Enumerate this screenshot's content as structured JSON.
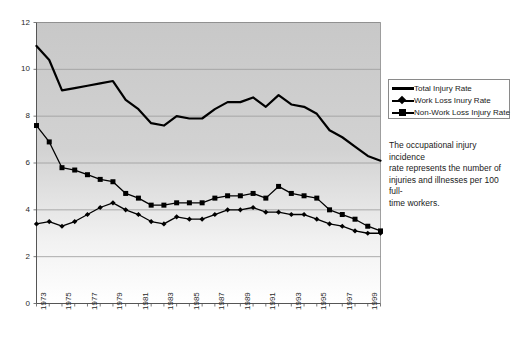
{
  "chart_data": {
    "type": "line",
    "title": "",
    "xlabel": "",
    "ylabel": "",
    "ylim": [
      0,
      12
    ],
    "ytick_step": 2,
    "yticks": [
      0,
      2,
      4,
      6,
      8,
      10,
      12
    ],
    "grid": "horizontal",
    "legend_position": "right",
    "x": [
      1973,
      1974,
      1975,
      1976,
      1977,
      1978,
      1979,
      1980,
      1981,
      1982,
      1983,
      1984,
      1985,
      1986,
      1987,
      1988,
      1989,
      1990,
      1991,
      1992,
      1993,
      1994,
      1995,
      1996,
      1997,
      1998,
      1999,
      2000
    ],
    "xtick_labels": [
      "1973",
      "1975",
      "1977",
      "1979",
      "1981",
      "1983",
      "1985",
      "1987",
      "1989",
      "1991",
      "1993",
      "1995",
      "1997",
      "1999"
    ],
    "series": [
      {
        "name": "Total Injury Rate",
        "marker": "none",
        "color": "#000000",
        "values": [
          11.0,
          10.4,
          9.1,
          9.2,
          9.3,
          9.4,
          9.5,
          8.7,
          8.3,
          7.7,
          7.6,
          8.0,
          7.9,
          7.9,
          8.3,
          8.6,
          8.6,
          8.8,
          8.4,
          8.9,
          8.5,
          8.4,
          8.1,
          7.4,
          7.1,
          6.7,
          6.3,
          6.1
        ]
      },
      {
        "name": "Work Loss Inury Rate",
        "marker": "diamond",
        "color": "#000000",
        "values": [
          3.4,
          3.5,
          3.3,
          3.5,
          3.8,
          4.1,
          4.3,
          4.0,
          3.8,
          3.5,
          3.4,
          3.7,
          3.6,
          3.6,
          3.8,
          4.0,
          4.0,
          4.1,
          3.9,
          3.9,
          3.8,
          3.8,
          3.6,
          3.4,
          3.3,
          3.1,
          3.0,
          3.0
        ]
      },
      {
        "name": "Non-Work Loss Injury Rate",
        "marker": "square",
        "color": "#000000",
        "values": [
          7.6,
          6.9,
          5.8,
          5.7,
          5.5,
          5.3,
          5.2,
          4.7,
          4.5,
          4.2,
          4.2,
          4.3,
          4.3,
          4.3,
          4.5,
          4.6,
          4.6,
          4.7,
          4.5,
          5.0,
          4.7,
          4.6,
          4.5,
          4.0,
          3.8,
          3.6,
          3.3,
          3.1
        ]
      }
    ],
    "note": "The occupational injury incidence rate represents the number of injuries and illnesses per 100  full-time workers.",
    "note_lines": [
      "The occupational injury incidence",
      "rate represents the number of",
      "injuries and illnesses per 100  full-",
      "time workers."
    ]
  }
}
